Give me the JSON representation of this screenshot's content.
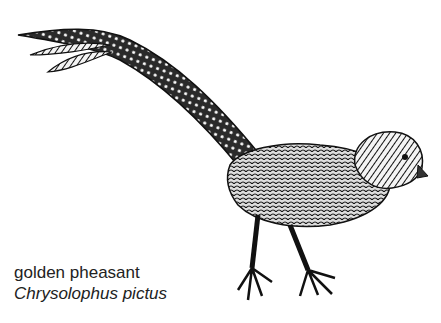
{
  "illustration": {
    "subject": "golden pheasant line drawing",
    "style": "black-and-white engraving"
  },
  "caption": {
    "common_name": "golden pheasant",
    "scientific_name": "Chrysolophus pictus"
  }
}
